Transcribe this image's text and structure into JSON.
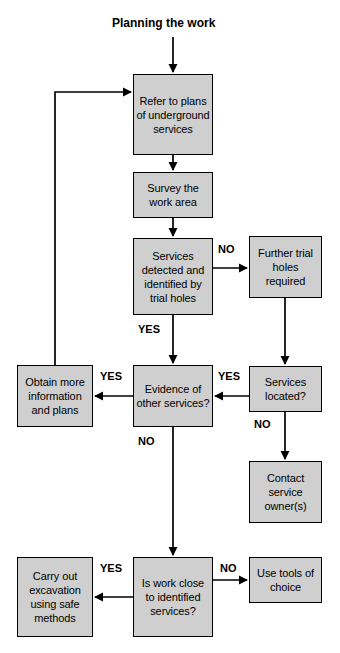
{
  "diagram": {
    "title": "Planning the work",
    "title_x": 112,
    "title_y": 16,
    "background_color": "#ffffff",
    "node_fill_color": "#cfcfcf",
    "node_border_color": "#000000",
    "line_color": "#000000"
  },
  "nodes": [
    {
      "id": "refer-to-plans",
      "text": "Refer to plans of underground services",
      "x": 133,
      "y": 74,
      "w": 80,
      "h": 81
    },
    {
      "id": "survey-work-area",
      "text": "Survey the work area",
      "x": 133,
      "y": 172,
      "w": 80,
      "h": 46
    },
    {
      "id": "services-detected",
      "text": "Services detected and identified by trial holes",
      "x": 133,
      "y": 238,
      "w": 80,
      "h": 77
    },
    {
      "id": "further-trial-holes",
      "text": "Further trial holes required",
      "x": 249,
      "y": 236,
      "w": 73,
      "h": 62
    },
    {
      "id": "obtain-more-info",
      "text": "Obtain more information and plans",
      "x": 17,
      "y": 365,
      "w": 76,
      "h": 62
    },
    {
      "id": "evidence-other-services",
      "text": "Evidence of other services?",
      "x": 133,
      "y": 365,
      "w": 80,
      "h": 62
    },
    {
      "id": "services-located",
      "text": "Services located?",
      "x": 249,
      "y": 366,
      "w": 73,
      "h": 46
    },
    {
      "id": "contact-service-owners",
      "text": "Contact service owner(s)",
      "x": 249,
      "y": 461,
      "w": 73,
      "h": 62
    },
    {
      "id": "carry-out-excavation",
      "text": "Carry out excavation using safe methods",
      "x": 17,
      "y": 557,
      "w": 76,
      "h": 80
    },
    {
      "id": "is-work-close",
      "text": "Is work close to identified services?",
      "x": 133,
      "y": 557,
      "w": 80,
      "h": 80
    },
    {
      "id": "use-tools-of-choice",
      "text": "Use tools of choice",
      "x": 249,
      "y": 557,
      "w": 73,
      "h": 46
    }
  ],
  "edge_labels": [
    {
      "id": "no-services-detected",
      "text": "NO",
      "x": 218,
      "y": 243
    },
    {
      "id": "yes-services-detected",
      "text": "YES",
      "x": 138,
      "y": 323
    },
    {
      "id": "yes-evidence-left",
      "text": "YES",
      "x": 100,
      "y": 370
    },
    {
      "id": "yes-services-located",
      "text": "YES",
      "x": 218,
      "y": 370
    },
    {
      "id": "no-services-located",
      "text": "NO",
      "x": 254,
      "y": 418
    },
    {
      "id": "no-evidence-down",
      "text": "NO",
      "x": 138,
      "y": 435
    },
    {
      "id": "yes-is-work-close",
      "text": "YES",
      "x": 100,
      "y": 562
    },
    {
      "id": "no-is-work-close",
      "text": "NO",
      "x": 220,
      "y": 562
    }
  ],
  "connectors": [
    {
      "id": "title-to-refer",
      "from": "title",
      "to": "refer-to-plans"
    },
    {
      "id": "refer-to-survey",
      "from": "refer-to-plans",
      "to": "survey-work-area"
    },
    {
      "id": "survey-to-services",
      "from": "survey-work-area",
      "to": "services-detected"
    },
    {
      "id": "services-no-to-trial",
      "from": "services-detected",
      "to": "further-trial-holes"
    },
    {
      "id": "services-yes-to-evidence",
      "from": "services-detected",
      "to": "evidence-other-services"
    },
    {
      "id": "trial-to-located",
      "from": "further-trial-holes",
      "to": "services-located"
    },
    {
      "id": "located-yes-to-evidence",
      "from": "services-located",
      "to": "evidence-other-services"
    },
    {
      "id": "located-no-to-contact",
      "from": "services-located",
      "to": "contact-service-owners"
    },
    {
      "id": "evidence-yes-to-obtain",
      "from": "evidence-other-services",
      "to": "obtain-more-info"
    },
    {
      "id": "evidence-no-to-iswork",
      "from": "evidence-other-services",
      "to": "is-work-close"
    },
    {
      "id": "obtain-loop-to-refer",
      "from": "obtain-more-info",
      "to": "refer-to-plans"
    },
    {
      "id": "iswork-yes-to-carryout",
      "from": "is-work-close",
      "to": "carry-out-excavation"
    },
    {
      "id": "iswork-no-to-usetools",
      "from": "is-work-close",
      "to": "use-tools-of-choice"
    }
  ]
}
